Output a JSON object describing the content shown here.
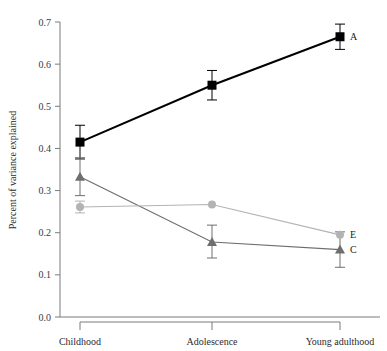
{
  "chart_data": {
    "type": "line",
    "title": "",
    "subtitle": "",
    "xlabel": "",
    "ylabel": "Percent of variance explained",
    "categories": [
      "Childhood",
      "Adolescence",
      "Young adulthood"
    ],
    "ylim": [
      0.0,
      0.7
    ],
    "ytick_labels": [
      "0.0",
      "0.1",
      "0.2",
      "0.3",
      "0.4",
      "0.5",
      "0.6",
      "0.7"
    ],
    "ytick_values": [
      0.0,
      0.1,
      0.2,
      0.3,
      0.4,
      0.5,
      0.6,
      0.7
    ],
    "grid": false,
    "legend_position": "inline-right-of-last-point",
    "series": [
      {
        "name": "A",
        "label": "A",
        "marker": "square",
        "color": "#000000",
        "values": [
          0.415,
          0.55,
          0.665
        ],
        "error_low": [
          0.375,
          0.515,
          0.635
        ],
        "error_high": [
          0.455,
          0.585,
          0.695
        ]
      },
      {
        "name": "C",
        "label": "C",
        "marker": "triangle",
        "color": "#6e6e6e",
        "values": [
          0.333,
          0.178,
          0.16
        ],
        "error_low": [
          0.288,
          0.14,
          0.118
        ],
        "error_high": [
          0.378,
          0.218,
          0.202
        ]
      },
      {
        "name": "E",
        "label": "E",
        "marker": "circle",
        "color": "#b3b3b3",
        "values": [
          0.261,
          0.267,
          0.195
        ],
        "error_low": [
          0.247,
          0.267,
          0.195
        ],
        "error_high": [
          0.275,
          0.267,
          0.195
        ]
      }
    ]
  },
  "colors": {
    "series_a": "#000000",
    "series_c": "#6e6e6e",
    "series_e": "#b3b3b3",
    "axis": "#7a7a7a",
    "text": "#2b2b2b",
    "background": "#ffffff"
  }
}
